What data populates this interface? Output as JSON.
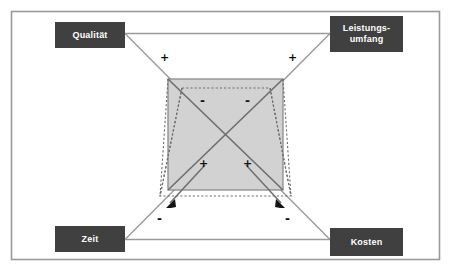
{
  "diagram": {
    "type": "project-management-magic-triangle",
    "frame": {
      "border_color": "#9a9a9a",
      "background": "#ffffff"
    },
    "corners": [
      {
        "id": "qualitaet",
        "label": "Qualität",
        "position": "top-left",
        "box_color": "#404040",
        "text_color": "#ffffff"
      },
      {
        "id": "leistungsumfang",
        "label": "Leistungs-\numfang",
        "line1": "Leistungs-",
        "line2": "umfang",
        "position": "top-right",
        "box_color": "#404040",
        "text_color": "#ffffff"
      },
      {
        "id": "zeit",
        "label": "Zeit",
        "position": "bottom-left",
        "box_color": "#404040",
        "text_color": "#ffffff"
      },
      {
        "id": "kosten",
        "label": "Kosten",
        "position": "bottom-right",
        "box_color": "#404040",
        "text_color": "#ffffff"
      }
    ],
    "signs": [
      {
        "id": "plus-top-left",
        "symbol": "+",
        "x": 160,
        "y": 52,
        "region": "outer-upper-left-diagonal"
      },
      {
        "id": "plus-top-right",
        "symbol": "+",
        "x": 288,
        "y": 52,
        "region": "outer-upper-right-diagonal"
      },
      {
        "id": "minus-inner-left",
        "symbol": "-",
        "x": 200,
        "y": 95,
        "region": "inner-box-top-left"
      },
      {
        "id": "minus-inner-right",
        "symbol": "-",
        "x": 245,
        "y": 95,
        "region": "inner-box-top-right"
      },
      {
        "id": "plus-inner-left",
        "symbol": "+",
        "x": 199,
        "y": 158,
        "region": "inner-box-bottom-left"
      },
      {
        "id": "plus-inner-right",
        "symbol": "+",
        "x": 243,
        "y": 158,
        "region": "inner-box-bottom-right"
      },
      {
        "id": "minus-outer-left",
        "symbol": "-",
        "x": 157,
        "y": 213,
        "region": "below-box-left-arrow"
      },
      {
        "id": "minus-outer-right",
        "symbol": "-",
        "x": 285,
        "y": 213,
        "region": "below-box-right-arrow"
      }
    ],
    "shapes": {
      "inner_rectangle": {
        "fill": "#d0d0d0",
        "stroke": "#808080",
        "x": 168,
        "y": 79,
        "width": 115,
        "height": 111
      },
      "dotted_overlay": {
        "stroke": "#707070",
        "style": "dashed",
        "description": "trapezoid / hourglass outline overlapping the grey rectangle"
      },
      "connector_lines": {
        "stroke": "#909090",
        "description": "horizontal top and bottom connectors plus crossing diagonals between the four corner boxes"
      },
      "arrow_heads": {
        "count": 2,
        "fill": "#101010",
        "direction": "down-outward"
      }
    }
  }
}
